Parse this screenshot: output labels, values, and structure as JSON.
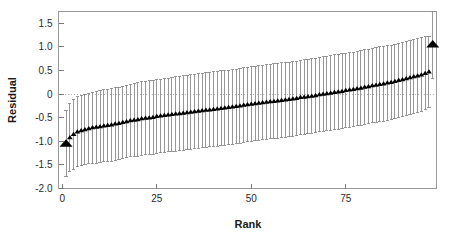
{
  "chart_data": {
    "type": "scatter",
    "title": "",
    "xlabel": "Rank",
    "ylabel": "Residual",
    "xlim": [
      -1,
      99
    ],
    "ylim": [
      -2.0,
      1.75
    ],
    "grid": false,
    "zero_line": true,
    "legend": "none",
    "xticks": [
      0,
      25,
      50,
      75
    ],
    "xticklabels": [
      "0",
      "25",
      "50",
      "75"
    ],
    "yticks": [
      1.5,
      1.0,
      0.5,
      0,
      -0.5,
      -1.0,
      -1.5,
      -2.0
    ],
    "yticklabels": [
      "1.5",
      "1.0",
      "0.5",
      "0",
      "-0.5",
      "-1.0",
      "-1.5",
      "-2.0"
    ],
    "marker": "triangle-up",
    "marker_color": "#000000",
    "errorbar_color": "#8c8c8c",
    "errorbar_caps": true,
    "highlight_indices": [
      0,
      97
    ],
    "series": [
      {
        "name": "Residual",
        "x": [
          1,
          2,
          3,
          4,
          5,
          6,
          7,
          8,
          9,
          10,
          11,
          12,
          13,
          14,
          15,
          16,
          17,
          18,
          19,
          20,
          21,
          22,
          23,
          24,
          25,
          26,
          27,
          28,
          29,
          30,
          31,
          32,
          33,
          34,
          35,
          36,
          37,
          38,
          39,
          40,
          41,
          42,
          43,
          44,
          45,
          46,
          47,
          48,
          49,
          50,
          51,
          52,
          53,
          54,
          55,
          56,
          57,
          58,
          59,
          60,
          61,
          62,
          63,
          64,
          65,
          66,
          67,
          68,
          69,
          70,
          71,
          72,
          73,
          74,
          75,
          76,
          77,
          78,
          79,
          80,
          81,
          82,
          83,
          84,
          85,
          86,
          87,
          88,
          89,
          90,
          91,
          92,
          93,
          94,
          95,
          96,
          97,
          98
        ],
        "y": [
          -1.05,
          -0.92,
          -0.85,
          -0.8,
          -0.77,
          -0.75,
          -0.73,
          -0.71,
          -0.7,
          -0.69,
          -0.67,
          -0.66,
          -0.65,
          -0.63,
          -0.62,
          -0.6,
          -0.58,
          -0.56,
          -0.55,
          -0.54,
          -0.52,
          -0.51,
          -0.5,
          -0.49,
          -0.47,
          -0.46,
          -0.45,
          -0.44,
          -0.43,
          -0.42,
          -0.41,
          -0.4,
          -0.39,
          -0.38,
          -0.37,
          -0.36,
          -0.35,
          -0.34,
          -0.33,
          -0.32,
          -0.31,
          -0.3,
          -0.29,
          -0.28,
          -0.27,
          -0.26,
          -0.25,
          -0.23,
          -0.22,
          -0.21,
          -0.2,
          -0.19,
          -0.18,
          -0.17,
          -0.16,
          -0.15,
          -0.14,
          -0.13,
          -0.12,
          -0.11,
          -0.1,
          -0.09,
          -0.07,
          -0.06,
          -0.05,
          -0.04,
          -0.03,
          -0.01,
          0.0,
          0.01,
          0.02,
          0.04,
          0.05,
          0.06,
          0.08,
          0.09,
          0.1,
          0.12,
          0.13,
          0.15,
          0.16,
          0.18,
          0.19,
          0.21,
          0.22,
          0.24,
          0.25,
          0.27,
          0.29,
          0.31,
          0.33,
          0.35,
          0.37,
          0.39,
          0.41,
          0.44,
          0.47,
          1.05
        ],
        "yerr_lower": [
          0.7,
          0.72,
          0.74,
          0.74,
          0.75,
          0.75,
          0.75,
          0.75,
          0.76,
          0.76,
          0.76,
          0.76,
          0.77,
          0.77,
          0.77,
          0.77,
          0.77,
          0.77,
          0.78,
          0.78,
          0.78,
          0.78,
          0.78,
          0.78,
          0.78,
          0.78,
          0.78,
          0.78,
          0.79,
          0.79,
          0.79,
          0.79,
          0.79,
          0.79,
          0.79,
          0.79,
          0.79,
          0.79,
          0.79,
          0.79,
          0.79,
          0.79,
          0.79,
          0.79,
          0.79,
          0.79,
          0.79,
          0.79,
          0.79,
          0.79,
          0.79,
          0.79,
          0.79,
          0.79,
          0.79,
          0.79,
          0.79,
          0.79,
          0.79,
          0.79,
          0.79,
          0.79,
          0.79,
          0.79,
          0.79,
          0.79,
          0.79,
          0.79,
          0.79,
          0.79,
          0.79,
          0.79,
          0.79,
          0.79,
          0.79,
          0.79,
          0.79,
          0.79,
          0.79,
          0.79,
          0.79,
          0.79,
          0.79,
          0.79,
          0.79,
          0.79,
          0.79,
          0.79,
          0.79,
          0.79,
          0.79,
          0.79,
          0.78,
          0.78,
          0.78,
          0.77,
          0.76,
          0.72
        ],
        "yerr_upper": [
          0.7,
          0.72,
          0.74,
          0.74,
          0.75,
          0.75,
          0.75,
          0.75,
          0.76,
          0.76,
          0.76,
          0.76,
          0.77,
          0.77,
          0.77,
          0.77,
          0.77,
          0.77,
          0.78,
          0.78,
          0.78,
          0.78,
          0.78,
          0.78,
          0.78,
          0.78,
          0.78,
          0.78,
          0.79,
          0.79,
          0.79,
          0.79,
          0.79,
          0.79,
          0.79,
          0.79,
          0.79,
          0.79,
          0.79,
          0.79,
          0.79,
          0.79,
          0.79,
          0.79,
          0.79,
          0.79,
          0.79,
          0.79,
          0.79,
          0.79,
          0.79,
          0.79,
          0.79,
          0.79,
          0.79,
          0.79,
          0.79,
          0.79,
          0.79,
          0.79,
          0.79,
          0.79,
          0.79,
          0.79,
          0.79,
          0.79,
          0.79,
          0.79,
          0.79,
          0.79,
          0.79,
          0.79,
          0.79,
          0.79,
          0.79,
          0.79,
          0.79,
          0.79,
          0.79,
          0.79,
          0.79,
          0.79,
          0.79,
          0.79,
          0.79,
          0.79,
          0.79,
          0.79,
          0.79,
          0.79,
          0.79,
          0.79,
          0.78,
          0.78,
          0.78,
          0.77,
          0.76,
          0.7
        ]
      }
    ]
  },
  "axes": {
    "x_title": "Rank",
    "y_title": "Residual"
  },
  "style": {
    "frame_color": "#9a9a9a",
    "tick_color": "#7a7a7a",
    "zero_line_color": "#b0b0b0",
    "background": "#ffffff",
    "marker_color": "#000000",
    "errorbar_color": "#8c8c8c"
  }
}
